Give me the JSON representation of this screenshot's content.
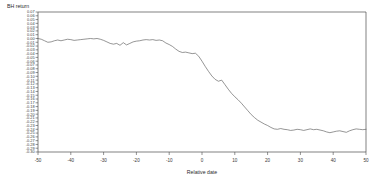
{
  "chart_data": {
    "type": "line",
    "title": "",
    "xlabel": "Relative date",
    "ylabel": "BH return",
    "xlim": [
      -50,
      50
    ],
    "ylim": [
      -0.3,
      0.07
    ],
    "grid": false,
    "legend": "none",
    "xticks": [
      -50,
      -40,
      -30,
      -20,
      -10,
      0,
      10,
      20,
      30,
      40,
      50
    ],
    "xtick_labels": [
      "-50",
      "-40",
      "-30",
      "-20",
      "-10",
      "0",
      "10",
      "20",
      "30",
      "40",
      "50"
    ],
    "yticks": [
      0.07,
      0.06,
      0.05,
      0.04,
      0.03,
      0.02,
      0.01,
      0.0,
      -0.01,
      -0.02,
      -0.03,
      -0.04,
      -0.05,
      -0.06,
      -0.07,
      -0.08,
      -0.09,
      -0.1,
      -0.11,
      -0.12,
      -0.13,
      -0.14,
      -0.15,
      -0.16,
      -0.17,
      -0.18,
      -0.19,
      -0.2,
      -0.21,
      -0.22,
      -0.23,
      -0.24,
      -0.25,
      -0.26,
      -0.27,
      -0.28,
      -0.29,
      -0.3
    ],
    "ytick_labels": [
      "0.07",
      "0.06",
      "0.05",
      "0.04",
      "0.03",
      "0.02",
      "0.01",
      "0.00",
      "-0.01",
      "-0.02",
      "-0.03",
      "-0.04",
      "-0.05",
      "-0.06",
      "-0.07",
      "-0.08",
      "-0.09",
      "-0.10",
      "-0.11",
      "-0.12",
      "-0.13",
      "-0.14",
      "-0.15",
      "-0.16",
      "-0.17",
      "-0.18",
      "-0.19",
      "-0.20",
      "-0.21",
      "-0.22",
      "-0.23",
      "-0.24",
      "-0.25",
      "-0.26",
      "-0.27",
      "-0.28",
      "-0.29",
      "-0.30"
    ],
    "series": [
      {
        "name": "BH return",
        "color": "#5c5c5c",
        "x": [
          -50,
          -49,
          -48,
          -47,
          -46,
          -45,
          -44,
          -43,
          -42,
          -41,
          -40,
          -39,
          -38,
          -37,
          -36,
          -35,
          -34,
          -33,
          -32,
          -31,
          -30,
          -29,
          -28,
          -27,
          -26,
          -25,
          -24,
          -23,
          -22,
          -21,
          -20,
          -19,
          -18,
          -17,
          -16,
          -15,
          -14,
          -13,
          -12,
          -11,
          -10,
          -9,
          -8,
          -7,
          -6,
          -5,
          -4,
          -3,
          -2,
          -1,
          0,
          1,
          2,
          3,
          4,
          5,
          6,
          7,
          8,
          9,
          10,
          11,
          12,
          13,
          14,
          15,
          16,
          17,
          18,
          19,
          20,
          21,
          22,
          23,
          24,
          25,
          26,
          27,
          28,
          29,
          30,
          31,
          32,
          33,
          34,
          35,
          36,
          37,
          38,
          39,
          40,
          41,
          42,
          43,
          44,
          45,
          46,
          47,
          48,
          49,
          50
        ],
        "y": [
          0.0,
          -0.002,
          -0.006,
          -0.01,
          -0.009,
          -0.006,
          -0.004,
          -0.006,
          -0.004,
          -0.002,
          -0.003,
          -0.005,
          -0.004,
          -0.003,
          -0.002,
          -0.001,
          0.0,
          -0.001,
          0.0,
          -0.002,
          -0.005,
          -0.009,
          -0.013,
          -0.015,
          -0.013,
          -0.018,
          -0.011,
          -0.017,
          -0.013,
          -0.009,
          -0.007,
          -0.006,
          -0.004,
          -0.003,
          -0.004,
          -0.003,
          -0.005,
          -0.004,
          -0.006,
          -0.012,
          -0.016,
          -0.021,
          -0.028,
          -0.034,
          -0.037,
          -0.036,
          -0.038,
          -0.04,
          -0.039,
          -0.047,
          -0.06,
          -0.074,
          -0.087,
          -0.099,
          -0.108,
          -0.113,
          -0.11,
          -0.122,
          -0.134,
          -0.145,
          -0.154,
          -0.162,
          -0.171,
          -0.181,
          -0.191,
          -0.201,
          -0.209,
          -0.216,
          -0.221,
          -0.226,
          -0.23,
          -0.235,
          -0.239,
          -0.24,
          -0.238,
          -0.24,
          -0.241,
          -0.243,
          -0.242,
          -0.24,
          -0.241,
          -0.243,
          -0.241,
          -0.239,
          -0.241,
          -0.24,
          -0.242,
          -0.244,
          -0.247,
          -0.249,
          -0.247,
          -0.245,
          -0.244,
          -0.246,
          -0.248,
          -0.244,
          -0.241,
          -0.239,
          -0.24,
          -0.241,
          -0.24
        ]
      }
    ]
  },
  "axes": {
    "ylabel_text": "BH return",
    "xlabel_text": "Relative date"
  }
}
